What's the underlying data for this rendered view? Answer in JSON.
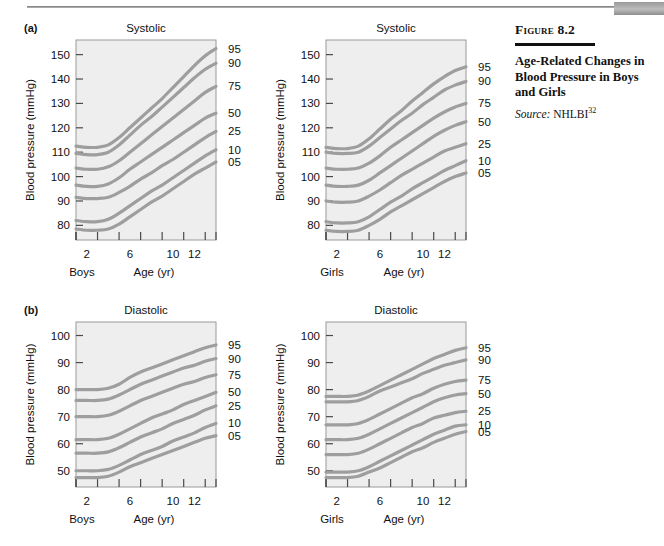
{
  "page": {
    "top_tab_color": "#a0a0a0",
    "rule_color": "#8a8a8a"
  },
  "caption": {
    "figure_label": "Figure 8.2",
    "title": "Age-Related Changes in Blood Pressure in Boys and Girls",
    "source_label": "Source:",
    "source_value": "NHLBI",
    "source_superscript": "32"
  },
  "panels": [
    {
      "letter": "(a)",
      "title": "Systolic",
      "group": "Boys"
    },
    {
      "letter": "",
      "title": "Systolic",
      "group": "Girls"
    },
    {
      "letter": "(b)",
      "title": "Diastolic",
      "group": "Boys"
    },
    {
      "letter": "",
      "title": "Diastolic",
      "group": "Girls"
    }
  ],
  "axis": {
    "ylabel": "Blood pressure (mmHg)",
    "xlabel": "Age (yr)",
    "percentile_label": "Percentile",
    "x_ticks": [
      1,
      3,
      5,
      7,
      9,
      11,
      13
    ],
    "x_tick_labels": [
      "2",
      "6",
      "10",
      "12"
    ],
    "x_tick_label_values": [
      2,
      6,
      10,
      12
    ],
    "xlim": [
      1,
      14
    ],
    "systolic_y_ticks": [
      80,
      90,
      100,
      110,
      120,
      130,
      140,
      150
    ],
    "systolic_ylim": [
      74,
      156
    ],
    "diastolic_y_ticks": [
      50,
      60,
      70,
      80,
      90,
      100
    ],
    "diastolic_ylim": [
      44,
      105
    ]
  },
  "style": {
    "plot_background": "#eeeeee",
    "plot_border": "#9a9a9a",
    "curve_color": "#9e9e9e",
    "curve_width": 3.2,
    "text_color": "#111111"
  },
  "chart_data": [
    {
      "type": "line",
      "id": "boys-systolic",
      "title": "Systolic",
      "group": "Boys",
      "panel": "(a)",
      "xlabel": "Age (yr)",
      "ylabel": "Blood pressure (mmHg)",
      "legend_label": "Percentile",
      "legend_position": "right",
      "grid": false,
      "xlim": [
        1,
        14
      ],
      "ylim": [
        74,
        156
      ],
      "x": [
        1,
        2,
        3,
        4,
        5,
        6,
        7,
        8,
        9,
        10,
        11,
        12,
        13,
        14
      ],
      "series": [
        {
          "name": "95",
          "values": [
            112.5,
            112.0,
            112.0,
            113.0,
            116.0,
            120.0,
            124.0,
            128.0,
            132.0,
            136.5,
            141.0,
            145.5,
            149.5,
            152.5
          ]
        },
        {
          "name": "90",
          "values": [
            109.5,
            109.0,
            109.0,
            110.0,
            113.0,
            117.0,
            121.0,
            124.5,
            128.5,
            132.5,
            136.5,
            140.5,
            144.0,
            146.5
          ]
        },
        {
          "name": "75",
          "values": [
            103.5,
            103.0,
            103.0,
            104.0,
            106.5,
            110.0,
            113.5,
            117.0,
            120.5,
            124.0,
            127.5,
            131.0,
            134.5,
            137.0
          ]
        },
        {
          "name": "50",
          "values": [
            96.5,
            96.0,
            96.0,
            97.0,
            99.5,
            103.0,
            106.0,
            109.0,
            112.0,
            115.0,
            118.0,
            121.0,
            124.0,
            126.0
          ]
        },
        {
          "name": "25",
          "values": [
            91.5,
            91.0,
            91.0,
            91.5,
            93.5,
            96.0,
            99.0,
            101.5,
            104.5,
            107.0,
            110.0,
            113.0,
            116.0,
            118.5
          ]
        },
        {
          "name": "10",
          "values": [
            82.0,
            81.5,
            81.5,
            82.5,
            85.0,
            88.0,
            91.0,
            94.0,
            96.5,
            99.5,
            102.5,
            105.5,
            108.5,
            111.0
          ]
        },
        {
          "name": "05",
          "values": [
            78.5,
            78.0,
            78.0,
            78.5,
            80.5,
            83.5,
            86.5,
            89.5,
            92.0,
            95.0,
            98.0,
            101.0,
            103.5,
            106.0
          ]
        }
      ]
    },
    {
      "type": "line",
      "id": "girls-systolic",
      "title": "Systolic",
      "group": "Girls",
      "panel": "",
      "xlabel": "Age (yr)",
      "ylabel": "Blood pressure (mmHg)",
      "legend_label": "Percentile",
      "legend_position": "right",
      "grid": false,
      "xlim": [
        1,
        14
      ],
      "ylim": [
        74,
        156
      ],
      "x": [
        1,
        2,
        3,
        4,
        5,
        6,
        7,
        8,
        9,
        10,
        11,
        12,
        13,
        14
      ],
      "series": [
        {
          "name": "95",
          "values": [
            112.0,
            111.5,
            111.5,
            112.5,
            115.5,
            119.5,
            123.5,
            127.0,
            131.0,
            134.5,
            138.0,
            141.0,
            143.5,
            145.0
          ]
        },
        {
          "name": "90",
          "values": [
            110.0,
            109.5,
            109.5,
            110.0,
            112.5,
            116.0,
            119.5,
            123.0,
            126.0,
            129.5,
            132.5,
            135.5,
            137.5,
            139.0
          ]
        },
        {
          "name": "75",
          "values": [
            103.5,
            103.0,
            103.0,
            103.5,
            105.5,
            108.5,
            112.0,
            115.0,
            118.0,
            121.0,
            124.0,
            126.5,
            128.5,
            130.0
          ]
        },
        {
          "name": "50",
          "values": [
            96.5,
            96.0,
            96.0,
            96.5,
            98.5,
            101.5,
            104.5,
            107.5,
            110.5,
            113.5,
            116.5,
            119.0,
            121.0,
            122.5
          ]
        },
        {
          "name": "25",
          "values": [
            90.0,
            89.5,
            89.5,
            90.0,
            92.0,
            94.5,
            97.5,
            100.5,
            103.0,
            105.5,
            108.0,
            110.5,
            112.0,
            113.5
          ]
        },
        {
          "name": "10",
          "values": [
            81.5,
            81.0,
            81.0,
            81.5,
            83.5,
            86.5,
            89.5,
            92.0,
            95.0,
            97.5,
            100.0,
            102.5,
            104.5,
            106.5
          ]
        },
        {
          "name": "05",
          "values": [
            78.0,
            77.5,
            77.5,
            78.0,
            80.0,
            82.5,
            85.5,
            88.0,
            90.5,
            93.0,
            95.5,
            98.0,
            100.0,
            101.5
          ]
        }
      ]
    },
    {
      "type": "line",
      "id": "boys-diastolic",
      "title": "Diastolic",
      "group": "Boys",
      "panel": "(b)",
      "xlabel": "Age (yr)",
      "ylabel": "Blood pressure (mmHg)",
      "legend_label": "Percentile",
      "legend_position": "right",
      "grid": false,
      "xlim": [
        1,
        14
      ],
      "ylim": [
        44,
        105
      ],
      "x": [
        1,
        2,
        3,
        4,
        5,
        6,
        7,
        8,
        9,
        10,
        11,
        12,
        13,
        14
      ],
      "series": [
        {
          "name": "95",
          "values": [
            80.0,
            80.0,
            80.0,
            80.5,
            82.0,
            84.5,
            86.5,
            88.0,
            89.5,
            91.0,
            92.5,
            94.0,
            95.5,
            96.5
          ]
        },
        {
          "name": "90",
          "values": [
            76.0,
            76.0,
            76.0,
            76.5,
            78.0,
            80.0,
            82.0,
            83.5,
            85.0,
            86.5,
            88.0,
            89.0,
            90.5,
            91.5
          ]
        },
        {
          "name": "75",
          "values": [
            70.0,
            70.0,
            70.0,
            70.5,
            72.0,
            74.0,
            76.0,
            77.5,
            79.0,
            80.5,
            82.0,
            83.0,
            84.5,
            85.5
          ]
        },
        {
          "name": "50",
          "values": [
            61.5,
            61.5,
            61.5,
            62.0,
            63.5,
            65.5,
            67.5,
            69.5,
            71.0,
            72.5,
            74.5,
            76.0,
            77.5,
            79.0
          ]
        },
        {
          "name": "25",
          "values": [
            56.5,
            56.5,
            56.5,
            57.0,
            58.5,
            60.5,
            62.5,
            64.0,
            65.5,
            67.5,
            69.0,
            70.5,
            72.5,
            74.0
          ]
        },
        {
          "name": "10",
          "values": [
            50.0,
            50.0,
            50.0,
            50.5,
            52.0,
            54.0,
            56.0,
            57.5,
            59.0,
            61.0,
            62.5,
            64.0,
            66.0,
            67.5
          ]
        },
        {
          "name": "05",
          "values": [
            47.5,
            47.5,
            47.5,
            48.0,
            49.5,
            51.5,
            53.0,
            54.5,
            56.0,
            57.5,
            59.0,
            60.5,
            62.0,
            63.0
          ]
        }
      ]
    },
    {
      "type": "line",
      "id": "girls-diastolic",
      "title": "Diastolic",
      "group": "Girls",
      "panel": "",
      "xlabel": "Age (yr)",
      "ylabel": "Blood pressure (mmHg)",
      "legend_label": "Percentile",
      "legend_position": "right",
      "grid": false,
      "xlim": [
        1,
        14
      ],
      "ylim": [
        44,
        105
      ],
      "x": [
        1,
        2,
        3,
        4,
        5,
        6,
        7,
        8,
        9,
        10,
        11,
        12,
        13,
        14
      ],
      "series": [
        {
          "name": "95",
          "values": [
            77.5,
            77.5,
            77.5,
            78.0,
            79.5,
            81.5,
            83.5,
            85.5,
            87.5,
            89.5,
            91.5,
            93.0,
            94.5,
            95.5
          ]
        },
        {
          "name": "90",
          "values": [
            75.5,
            75.5,
            75.5,
            76.0,
            77.5,
            79.5,
            81.0,
            82.5,
            84.0,
            86.0,
            87.5,
            89.0,
            90.0,
            91.0
          ]
        },
        {
          "name": "75",
          "values": [
            67.0,
            67.0,
            67.0,
            67.5,
            69.0,
            71.0,
            73.0,
            75.0,
            77.0,
            78.5,
            80.5,
            82.0,
            83.0,
            83.5
          ]
        },
        {
          "name": "50",
          "values": [
            61.5,
            61.5,
            61.5,
            62.0,
            63.5,
            65.5,
            67.5,
            69.5,
            71.5,
            73.5,
            75.5,
            77.0,
            78.0,
            78.5
          ]
        },
        {
          "name": "25",
          "values": [
            56.0,
            56.0,
            56.0,
            56.5,
            58.0,
            60.0,
            62.0,
            64.0,
            66.0,
            67.5,
            69.5,
            70.5,
            71.5,
            72.0
          ]
        },
        {
          "name": "10",
          "values": [
            49.5,
            49.5,
            49.5,
            50.0,
            51.5,
            53.5,
            55.5,
            57.5,
            59.5,
            61.5,
            63.5,
            65.0,
            66.5,
            67.0
          ]
        },
        {
          "name": "05",
          "values": [
            47.5,
            47.5,
            47.5,
            48.0,
            49.5,
            51.0,
            53.0,
            55.0,
            57.0,
            58.5,
            60.5,
            62.0,
            63.5,
            64.5
          ]
        }
      ]
    }
  ]
}
